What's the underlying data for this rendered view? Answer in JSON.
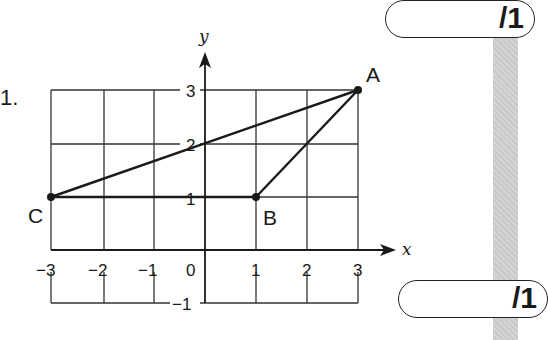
{
  "question": {
    "number_label": "1."
  },
  "marks": [
    {
      "label": "/1"
    },
    {
      "label": "/1"
    }
  ],
  "axes": {
    "x_label": "x",
    "y_label": "y"
  },
  "x_ticks": [
    "−3",
    "−2",
    "−1",
    "0",
    "1",
    "2",
    "3"
  ],
  "y_ticks": [
    "3",
    "2",
    "1",
    "−1"
  ],
  "points": [
    {
      "name": "A",
      "x": 3,
      "y": 3
    },
    {
      "name": "B",
      "x": 1,
      "y": 1
    },
    {
      "name": "C",
      "x": -3,
      "y": 1
    }
  ],
  "segments": [
    [
      "C",
      "A"
    ],
    [
      "C",
      "B"
    ],
    [
      "B",
      "A"
    ]
  ],
  "colors": {
    "ink": "#1a1a1a",
    "stripe": "#cfcfcf"
  }
}
